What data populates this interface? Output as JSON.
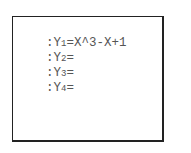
{
  "y_editor": {
    "entries": [
      {
        "prefix": ":Y",
        "index": "1",
        "expr": "=X^3-X+1"
      },
      {
        "prefix": ":Y",
        "index": "2",
        "expr": "="
      },
      {
        "prefix": ":Y",
        "index": "3",
        "expr": "="
      },
      {
        "prefix": ":Y",
        "index": "4",
        "expr": "="
      }
    ]
  }
}
